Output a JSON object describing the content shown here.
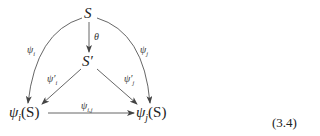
{
  "diagram": {
    "nodes": {
      "S": "S",
      "S_prime": "S′",
      "psi_i_S": {
        "base": "ψ",
        "sub": "i",
        "arg": "(S)"
      },
      "psi_j_S": {
        "base": "ψ",
        "sub": "j",
        "arg": "(S)"
      }
    },
    "edges": {
      "theta": "θ",
      "psi_i": {
        "base": "ψ",
        "sub": "i"
      },
      "psi_j": {
        "base": "ψ",
        "sub": "j"
      },
      "psi_i_prime": {
        "base": "ψ′",
        "sub": "i"
      },
      "psi_j_prime": {
        "base": "ψ′",
        "sub": "j"
      },
      "psi_ij": {
        "base": "ψ",
        "sub": "i,j"
      }
    },
    "equation_number": "(3.4)"
  }
}
